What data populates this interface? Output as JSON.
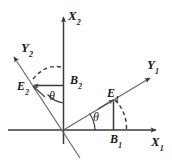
{
  "figure": {
    "type": "vector-decomposition-diagram",
    "background_color": "#ffffff",
    "line_color": "#3a3a3a",
    "text_color": "#1a1a1a",
    "rotation_angle_label": "θ"
  },
  "axes": [
    {
      "key": "x1",
      "label": "X",
      "subscript": "1",
      "direction": "right",
      "name": "x1-axis"
    },
    {
      "key": "x2",
      "label": "X",
      "subscript": "2",
      "direction": "up",
      "name": "x2-axis"
    },
    {
      "key": "y1",
      "label": "Y",
      "subscript": "1",
      "direction": "up-right",
      "name": "y1-axis"
    },
    {
      "key": "y2",
      "label": "Y",
      "subscript": "2",
      "direction": "up-left",
      "name": "y2-axis"
    }
  ],
  "vectors": [
    {
      "key": "e1",
      "label": "E",
      "subscript": "1",
      "along_axis": "y1",
      "name": "vector-e1"
    },
    {
      "key": "e2",
      "label": "E",
      "subscript": "2",
      "along_axis": "y2",
      "name": "vector-e2"
    }
  ],
  "components": [
    {
      "key": "b1",
      "label": "B",
      "subscript": "1",
      "of_vector": "e1",
      "on_axis": "x1",
      "name": "component-b1"
    },
    {
      "key": "b2",
      "label": "B",
      "subscript": "2",
      "of_vector": "e2",
      "on_axis": "x2",
      "name": "component-b2"
    }
  ],
  "angles": [
    {
      "key": "theta_right",
      "label": "θ",
      "between": [
        "x1",
        "y1"
      ],
      "name": "angle-theta-lower-right"
    },
    {
      "key": "theta_left",
      "label": "θ",
      "between": [
        "x2",
        "y2"
      ],
      "name": "angle-theta-upper-left"
    }
  ],
  "arcs": [
    {
      "key": "arc_b2",
      "style": "dashed",
      "from": "y2-axis",
      "to": "x2-axis",
      "name": "dashed-arc-upper-left"
    },
    {
      "key": "arc_b1",
      "style": "dashed",
      "from": "e1-foot",
      "to": "x1-axis",
      "name": "dashed-arc-lower-right"
    }
  ]
}
